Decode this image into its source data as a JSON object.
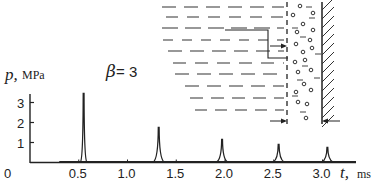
{
  "chart_data": {
    "type": "line",
    "title": "",
    "xlabel": {
      "var": "t,",
      "unit": "ms"
    },
    "ylabel": {
      "var": "p,",
      "unit": "MPa"
    },
    "annotation": {
      "symbol": "β",
      "text": " = 3"
    },
    "xlim": [
      0,
      3.3
    ],
    "ylim": [
      0,
      3.7
    ],
    "x_ticks": [
      0.5,
      1.0,
      1.5,
      2.0,
      2.5,
      3.0
    ],
    "x_tick_labels": [
      "0",
      "0.5",
      "1.0",
      "1.5",
      "2.0",
      "2.5",
      "3.0"
    ],
    "y_ticks": [
      1,
      2,
      3
    ],
    "y_tick_labels": [
      "1",
      "2",
      "3"
    ],
    "grid": false,
    "series": [
      {
        "name": "pressure pulses",
        "peaks": [
          {
            "t": 0.55,
            "p": 3.45
          },
          {
            "t": 1.32,
            "p": 1.75
          },
          {
            "t": 1.97,
            "p": 1.15
          },
          {
            "t": 2.55,
            "p": 0.9
          },
          {
            "t": 3.05,
            "p": 0.75
          }
        ],
        "baseline_start_t": 0.3
      }
    ],
    "inset": {
      "description": "schematic of liquid with bubble layer near a wall",
      "parts": [
        "dashed-liquid-lines",
        "bubble-layer",
        "hatched-wall",
        "arrows"
      ]
    }
  }
}
